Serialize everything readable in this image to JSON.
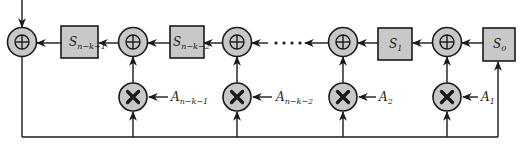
{
  "diagram": {
    "type": "lfsr-polynomial-division-circuit",
    "colors": {
      "fill": "#c8c8c8",
      "stroke": "#1a1a1a",
      "background": "#ffffff"
    },
    "registers": [
      {
        "id": "s_nk1",
        "base": "S",
        "sub": "n−k−1"
      },
      {
        "id": "s_nk2",
        "base": "S",
        "sub": "n−k−2"
      },
      {
        "id": "s1",
        "base": "S",
        "sub": "1"
      },
      {
        "id": "s0",
        "base": "S",
        "sub": "0"
      }
    ],
    "coefficients": [
      {
        "id": "a_nk1",
        "base": "A",
        "sub": "n−k−1"
      },
      {
        "id": "a_nk2",
        "base": "A",
        "sub": "n−k−2"
      },
      {
        "id": "a2",
        "base": "A",
        "sub": "2"
      },
      {
        "id": "a1",
        "base": "A",
        "sub": "1"
      }
    ],
    "adder_symbol": "⊕",
    "multiplier_symbol": "×",
    "ellipsis": "· · · ·"
  }
}
